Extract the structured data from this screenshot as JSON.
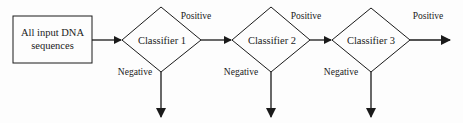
{
  "diagram": {
    "input_box": {
      "line1": "All input DNA",
      "line2": "sequences"
    },
    "classifiers": [
      {
        "label": "Classifier 1",
        "positive_label": "Positive",
        "negative_label": "Negative"
      },
      {
        "label": "Classifier 2",
        "positive_label": "Positive",
        "negative_label": "Negative"
      },
      {
        "label": "Classifier 3",
        "positive_label": "Positive",
        "negative_label": "Negative"
      }
    ],
    "colors": {
      "stroke": "#1a1a1a",
      "background": "#fdfdfd"
    }
  }
}
